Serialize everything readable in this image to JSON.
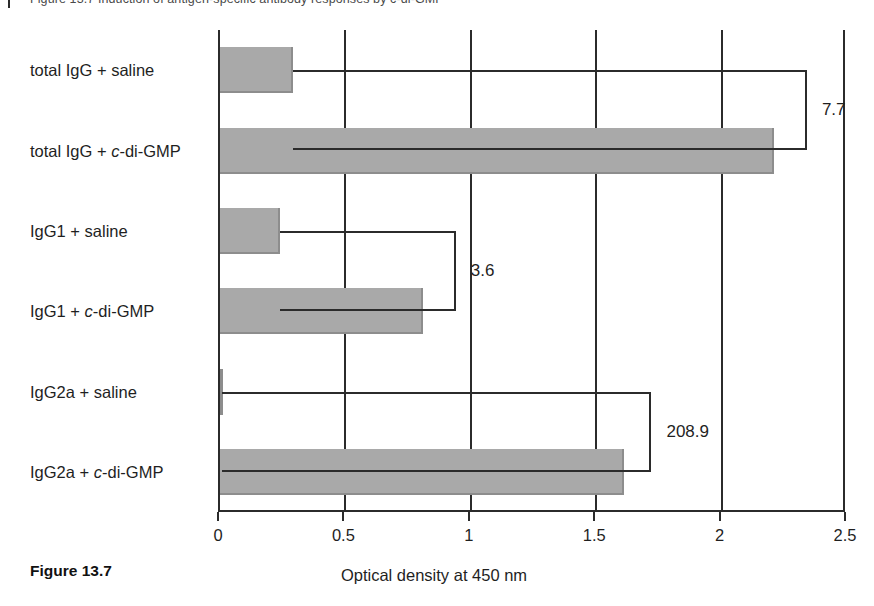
{
  "page": {
    "top_cut_text": "Figure 13.7  Induction of antigen-specific antibody responses by c-di-GMP",
    "figure_number": "Figure 13.7"
  },
  "chart_data": {
    "type": "bar",
    "orientation": "horizontal",
    "title": "",
    "xlabel": "Optical density at 450 nm",
    "ylabel": "",
    "xlim": [
      0,
      2.5
    ],
    "xticks": [
      "0",
      "0.5",
      "1",
      "1.5",
      "2",
      "2.5"
    ],
    "xtick_values": [
      0,
      0.5,
      1,
      1.5,
      2,
      2.5
    ],
    "grid": "vertical",
    "legend": "none",
    "bar_color": "#a9a9a9",
    "axis_color": "#2b2b2b",
    "categories": [
      "total IgG + saline",
      "total IgG + c-di-GMP",
      "IgG1 + saline",
      "IgG1 + c-di-GMP",
      "IgG2a + saline",
      "IgG2a + c-di-GMP"
    ],
    "category_labels_html": [
      "total IgG + saline",
      "total IgG + <i>c</i>-di-GMP",
      "IgG1 + saline",
      "IgG1 + <i>c</i>-di-GMP",
      "IgG2a + saline",
      "IgG2a + <i>c</i>-di-GMP"
    ],
    "values": [
      0.29,
      2.21,
      0.24,
      0.81,
      0.008,
      1.61
    ],
    "annotations": [
      {
        "label": "7.7",
        "pairs": [
          "total IgG + saline",
          "total IgG + c-di-GMP"
        ]
      },
      {
        "label": "3.6",
        "pairs": [
          "IgG1 + saline",
          "IgG1 + c-di-GMP"
        ]
      },
      {
        "label": "208.9",
        "pairs": [
          "IgG2a + saline",
          "IgG2a + c-di-GMP"
        ]
      }
    ]
  }
}
